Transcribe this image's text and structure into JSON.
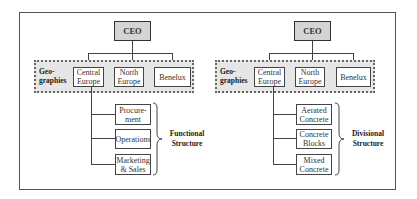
{
  "left": {
    "ceo": "CEO",
    "geographies_label_line1": "Geo-",
    "geographies_label_line2": "graphies",
    "geographies": [
      {
        "line1": "Central",
        "line2": "Europe"
      },
      {
        "line1": "North",
        "line2": "Europe"
      },
      {
        "line1": "Benelux",
        "line2": ""
      }
    ],
    "sub_units": [
      {
        "line1": "Procure-",
        "line2": "ment"
      },
      {
        "line1": "Operations",
        "line2": ""
      },
      {
        "line1": "Marketing",
        "line2": "& Sales"
      }
    ],
    "structure_label_line1": "Functional",
    "structure_label_line2": "Structure"
  },
  "right": {
    "ceo": "CEO",
    "geographies_label_line1": "Geo-",
    "geographies_label_line2": "graphies",
    "geographies": [
      {
        "line1": "Central",
        "line2": "Europe"
      },
      {
        "line1": "North",
        "line2": "Europe"
      },
      {
        "line1": "Benelux",
        "line2": ""
      }
    ],
    "sub_units": [
      {
        "line1": "Aerated",
        "line2": "Concrete"
      },
      {
        "line1": "Concrete",
        "line2": "Blocks"
      },
      {
        "line1": "Mixed",
        "line2": "Concrete"
      }
    ],
    "structure_label_line1": "Divisional",
    "structure_label_line2": "Structure"
  },
  "colors": {
    "ceo_fill": "#d4d4d4",
    "geographies_fill": "#e6e6e6",
    "line": "#444444"
  }
}
